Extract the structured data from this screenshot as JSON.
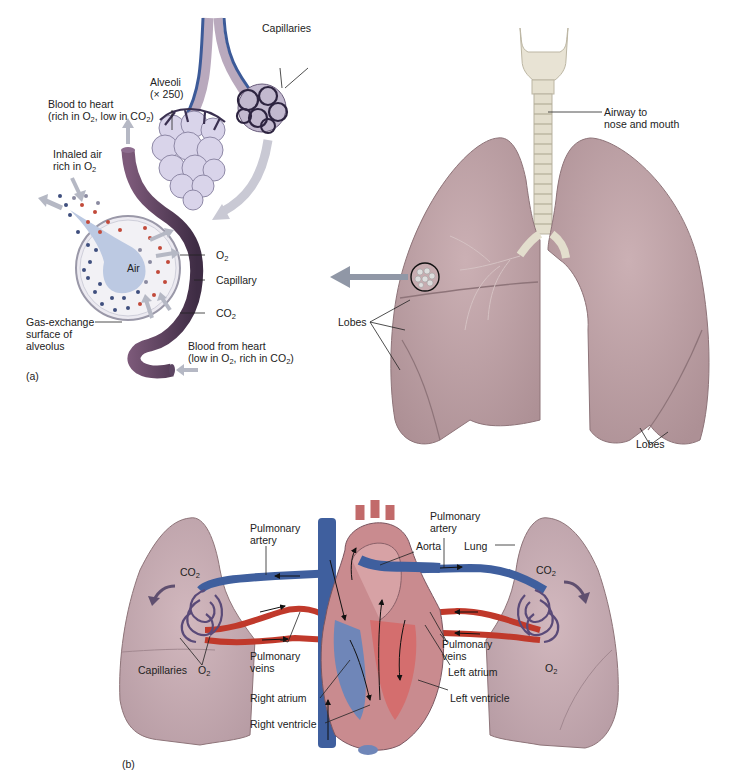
{
  "figure": {
    "panels": [
      {
        "id": "a",
        "tag": "(a)"
      },
      {
        "id": "b",
        "tag": "(b)"
      }
    ]
  },
  "panel_a": {
    "labels": {
      "capillaries": "Capillaries",
      "alveoli_line1": "Alveoli",
      "alveoli_line2": "(× 250)",
      "blood_to_heart_line1": "Blood to heart",
      "blood_to_heart_line2_pre": "(rich in O",
      "blood_to_heart_line2_mid": ", low in CO",
      "blood_to_heart_line2_post": ")",
      "inhaled_line1": "Inhaled air",
      "inhaled_line2_pre": "rich in O",
      "air": "Air",
      "o2_pre": "O",
      "capillary": "Capillary",
      "co2_pre": "CO",
      "gas_exchange_line1": "Gas-exchange",
      "gas_exchange_line2": "surface of",
      "gas_exchange_line3": "alveolus",
      "blood_from_heart_line1": "Blood from heart",
      "blood_from_heart_line2_pre": "(low in O",
      "blood_from_heart_line2_mid": ", rich in CO",
      "blood_from_heart_line2_post": ")",
      "sub2": "2"
    },
    "lungs_labels": {
      "airway_line1": "Airway to",
      "airway_line2": "nose and mouth",
      "lobes_left": "Lobes",
      "lobes_right": "Lobes"
    }
  },
  "panel_b": {
    "labels": {
      "pulmonary_artery_left_line1": "Pulmonary",
      "pulmonary_artery_left_line2": "artery",
      "pulmonary_artery_right_line1": "Pulmonary",
      "pulmonary_artery_right_line2": "artery",
      "aorta": "Aorta",
      "lung": "Lung",
      "co2_left_pre": "CO",
      "co2_right_pre": "CO",
      "capillaries": "Capillaries",
      "o2_left_pre": "O",
      "o2_right_pre": "O",
      "pulmonary_veins_left_line1": "Pulmonary",
      "pulmonary_veins_left_line2": "veins",
      "pulmonary_veins_right_line1": "Pulmonary",
      "pulmonary_veins_right_line2": "veins",
      "right_atrium": "Right atrium",
      "right_ventricle": "Right ventricle",
      "left_atrium": "Left atrium",
      "left_ventricle": "Left ventricle",
      "sub2": "2"
    }
  },
  "colors": {
    "lung": "#bfa2a6",
    "lung_dark": "#a9898e",
    "lung_b": "#c7aab2",
    "oxygenated": "#c0392b",
    "deoxygenated": "#3f5f9e",
    "capillary_tube": "#6d4a6a",
    "alveoli": "#d8d2e8",
    "air": "#b9c9e6",
    "trachea": "#e6e1d2",
    "arrow": "#b7b7c4"
  }
}
